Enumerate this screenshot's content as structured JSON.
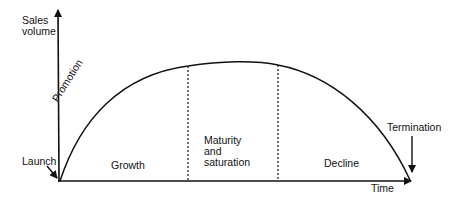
{
  "diagram": {
    "y_axis_label": [
      "Sales",
      "volume"
    ],
    "x_axis_label": "Time",
    "annotations": {
      "launch": "Launch",
      "promotion": "Promotion",
      "termination": "Termination"
    },
    "phases": [
      {
        "name": "Growth",
        "lines": [
          "Growth"
        ]
      },
      {
        "name": "Maturity and saturation",
        "lines": [
          "Maturity",
          "and",
          "saturation"
        ]
      },
      {
        "name": "Decline",
        "lines": [
          "Decline"
        ]
      }
    ],
    "colors": {
      "line": "#111111",
      "background": "#ffffff"
    }
  }
}
